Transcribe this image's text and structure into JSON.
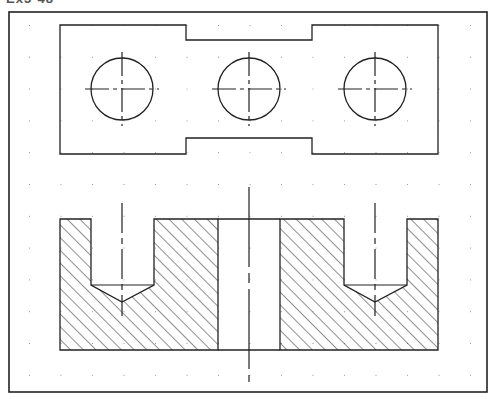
{
  "header": {
    "clipped_label": "Ex3-48"
  },
  "colors": {
    "line": "#222222",
    "grid": "#9a9a9a",
    "background": "#ffffff"
  },
  "frame": {
    "x": 9,
    "y": 12,
    "w": 478,
    "h": 380
  },
  "grid": {
    "x0": 29,
    "y0": 25,
    "dx": 31.5,
    "dy": 31.8,
    "cols": 15,
    "rows": 12
  },
  "top_view": {
    "outline": [
      [
        60,
        25
      ],
      [
        186,
        25
      ],
      [
        186,
        40
      ],
      [
        312,
        40
      ],
      [
        312,
        25
      ],
      [
        438,
        25
      ],
      [
        438,
        154
      ],
      [
        312,
        154
      ],
      [
        312,
        138
      ],
      [
        186,
        138
      ],
      [
        186,
        154
      ],
      [
        60,
        154
      ]
    ],
    "circles": [
      {
        "cx": 122,
        "cy": 89,
        "r": 31
      },
      {
        "cx": 249,
        "cy": 89,
        "r": 31
      },
      {
        "cx": 375,
        "cy": 89,
        "r": 31
      }
    ],
    "center_mark_half": 37
  },
  "front_view": {
    "x": 60,
    "y": 219,
    "w": 378,
    "h": 131,
    "slot": {
      "x1": 218,
      "x2": 280
    },
    "holes": [
      {
        "x1": 91,
        "x2": 154,
        "bottom": 285,
        "tip": 302,
        "cx": 122
      },
      {
        "x1": 344,
        "x2": 407,
        "bottom": 285,
        "tip": 302,
        "cx": 375
      }
    ],
    "hole_centerline": {
      "y1": 203,
      "y2": 316
    },
    "main_centerline": {
      "x": 249,
      "y1": 187,
      "y2": 382
    },
    "hatch_spacing": 9
  }
}
